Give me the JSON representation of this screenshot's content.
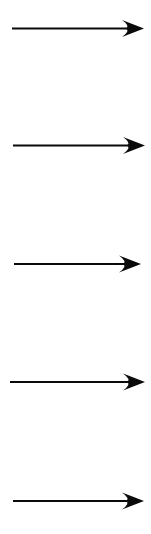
{
  "canvas": {
    "width": 151,
    "height": 534,
    "background_color": "#ffffff",
    "description": "Five identical horizontal right-pointing black arrows stacked vertically"
  },
  "style": {
    "arrow_color": "#0a0a0a",
    "shaft_thickness": 2.2,
    "arrowhead_length": 22,
    "arrowhead_half_width": 8.5,
    "arrowhead_notch": 4
  },
  "arrows": [
    {
      "id": "arrow-1",
      "label": "arrow-1",
      "direction": "right",
      "x_start": 12,
      "x_tip": 144,
      "y": 28.5
    },
    {
      "id": "arrow-2",
      "label": "arrow-2",
      "direction": "right",
      "x_start": 13,
      "x_tip": 145,
      "y": 145.5
    },
    {
      "id": "arrow-3",
      "label": "arrow-3",
      "direction": "right",
      "x_start": 14,
      "x_tip": 141,
      "y": 264.0
    },
    {
      "id": "arrow-4",
      "label": "arrow-4",
      "direction": "right",
      "x_start": 10,
      "x_tip": 145,
      "y": 382.0
    },
    {
      "id": "arrow-5",
      "label": "arrow-5",
      "direction": "right",
      "x_start": 13,
      "x_tip": 144,
      "y": 501.0
    }
  ]
}
